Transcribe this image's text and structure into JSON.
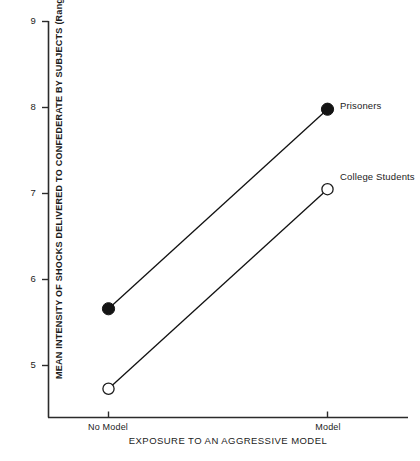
{
  "chart_data": {
    "type": "line",
    "title": "",
    "xlabel": "EXPOSURE TO AN AGGRESSIVE MODEL",
    "ylabel": "MEAN INTENSITY OF SHOCKS DELIVERED TO CONFEDERATE BY SUBJECTS (Range = 0-10)",
    "categories": [
      "No Model",
      "Model"
    ],
    "ylim": [
      4.15,
      9.0
    ],
    "yticks": [
      5,
      6,
      7,
      8,
      9
    ],
    "ytick_labels": [
      "5",
      "6",
      "7",
      "8",
      "9"
    ],
    "grid": false,
    "legend": "inline-right-of-endpoint",
    "series": [
      {
        "name": "Prisoners",
        "values": [
          5.66,
          7.98
        ],
        "marker": "filled-circle",
        "color": "#111111"
      },
      {
        "name": "College Students",
        "values": [
          4.73,
          7.05
        ],
        "marker": "open-circle",
        "color": "#111111"
      }
    ]
  },
  "axes": {
    "y_tick_0": "5",
    "y_tick_1": "6",
    "y_tick_2": "7",
    "y_tick_3": "8",
    "y_tick_4": "9",
    "x_tick_0": "No Model",
    "x_tick_1": "Model",
    "y_axis_title": "MEAN INTENSITY OF SHOCKS DELIVERED TO CONFEDERATE BY SUBJECTS (Range = 0-10)",
    "x_axis_title": "EXPOSURE TO AN AGGRESSIVE MODEL"
  },
  "annotations": {
    "prisoners_label": "Prisoners",
    "college_students_label": "College Students"
  },
  "colors": {
    "ink": "#111111",
    "axis": "#2b2b2b",
    "background": "#ffffff"
  }
}
